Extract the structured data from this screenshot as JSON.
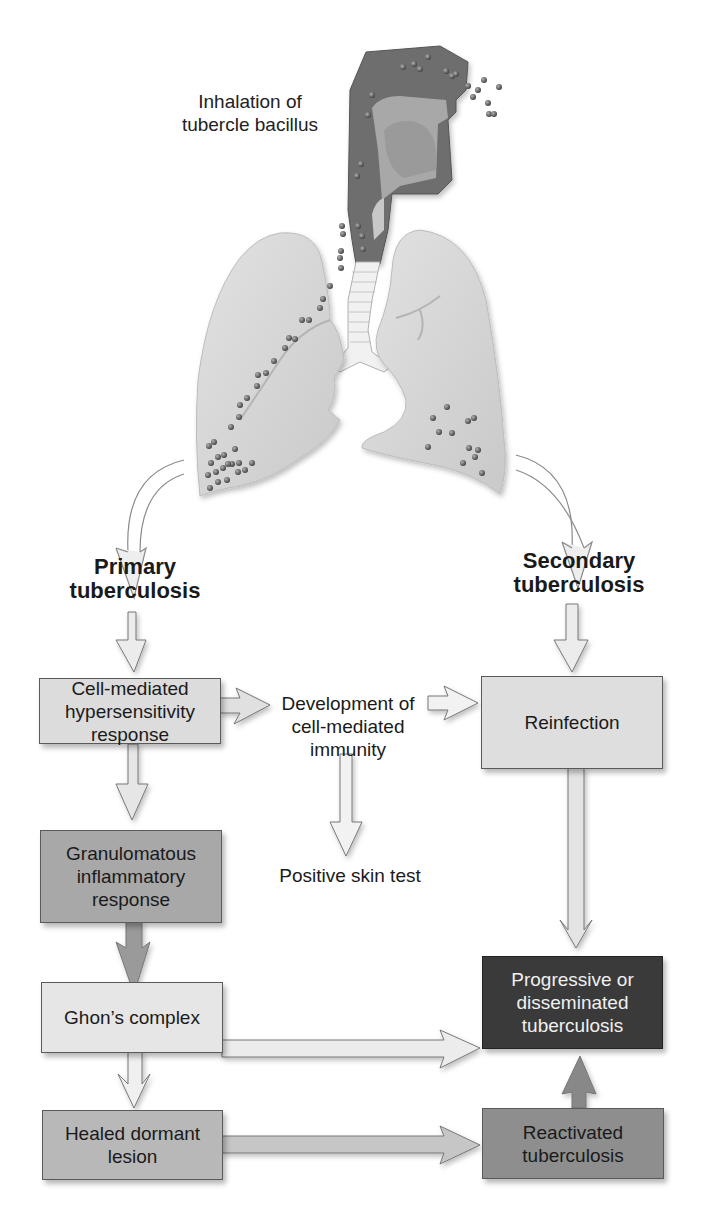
{
  "figure": {
    "title_label": "Inhalation of\ntubercle bacillus",
    "title_lines": [
      "Inhalation of",
      "tubercle bacillus"
    ],
    "branches": {
      "primary": {
        "lines": [
          "Primary",
          "tuberculosis"
        ]
      },
      "secondary": {
        "lines": [
          "Secondary",
          "tuberculosis"
        ]
      }
    },
    "nodes": {
      "cell_mediated": {
        "lines": [
          "Cell-mediated",
          "hypersensitivity",
          "response"
        ],
        "fill": "#dcdcdc"
      },
      "development": {
        "lines": [
          "Development of",
          "cell-mediated",
          "immunity"
        ]
      },
      "reinfection": {
        "lines": [
          "Reinfection"
        ],
        "fill": "#dedede"
      },
      "granulomatous": {
        "lines": [
          "Granulomatous",
          "inflammatory",
          "response"
        ],
        "fill": "#a8a8a8"
      },
      "positive_skin_test": {
        "lines": [
          "Positive skin test"
        ]
      },
      "ghons_complex": {
        "lines": [
          "Ghon’s complex"
        ],
        "fill": "#e6e6e6"
      },
      "progressive": {
        "lines": [
          "Progressive or",
          "disseminated",
          "tuberculosis"
        ],
        "fill": "#3a3a3a",
        "text_color": "#f0f0f0"
      },
      "healed": {
        "lines": [
          "Healed dormant",
          "lesion"
        ],
        "fill": "#b8b8b8"
      },
      "reactivated": {
        "lines": [
          "Reactivated",
          "tuberculosis"
        ],
        "fill": "#8e8e8e"
      }
    },
    "edges": [
      {
        "from": "lungs",
        "to": "primary"
      },
      {
        "from": "lungs",
        "to": "secondary"
      },
      {
        "from": "primary",
        "to": "cell_mediated"
      },
      {
        "from": "secondary",
        "to": "reinfection"
      },
      {
        "from": "cell_mediated",
        "to": "development"
      },
      {
        "from": "development",
        "to": "reinfection"
      },
      {
        "from": "development",
        "to": "positive_skin_test"
      },
      {
        "from": "cell_mediated",
        "to": "granulomatous"
      },
      {
        "from": "granulomatous",
        "to": "ghons_complex"
      },
      {
        "from": "reinfection",
        "to": "progressive"
      },
      {
        "from": "ghons_complex",
        "to": "progressive"
      },
      {
        "from": "ghons_complex",
        "to": "healed"
      },
      {
        "from": "healed",
        "to": "reactivated"
      },
      {
        "from": "reactivated",
        "to": "progressive"
      }
    ]
  }
}
